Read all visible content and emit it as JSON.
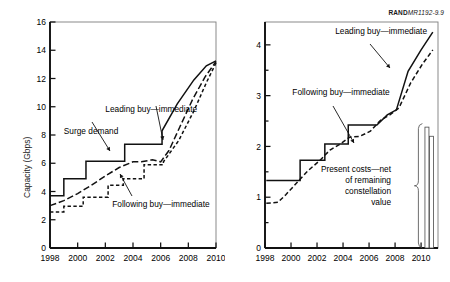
{
  "figure": {
    "credit_prefix": "RAND",
    "credit_id": "MR1192-9.9"
  },
  "chart_data": [
    {
      "id": "capacity",
      "type": "line",
      "title": "",
      "xlabel": "",
      "ylabel": "Capacity (Gbps)",
      "xlim": [
        1998,
        2010
      ],
      "ylim": [
        0,
        16
      ],
      "yticks": [
        0,
        2,
        4,
        6,
        8,
        10,
        12,
        14,
        16
      ],
      "ytick_labels": [
        "0",
        "2",
        "4",
        "6",
        "8",
        "10",
        "12",
        "14",
        "16"
      ],
      "xticks": [
        1998,
        2000,
        2002,
        2004,
        2006,
        2008,
        2010
      ],
      "xtick_labels": [
        "1998",
        "2000",
        "2002",
        "2004",
        "2006",
        "2008",
        "2010"
      ],
      "grid": false,
      "legend": "annotations",
      "annotations": [
        {
          "text": "Leading buy—immediate",
          "x": 2002.0,
          "y": 9.6
        },
        {
          "text": "Surge demand",
          "x": 1999.0,
          "y": 8.1
        },
        {
          "text": "Following buy—immediate",
          "x": 2002.5,
          "y": 2.9
        }
      ],
      "series": [
        {
          "name": "Surge demand",
          "style": "solid",
          "shape": "step",
          "x": [
            1998,
            1999,
            1999,
            2000.6,
            2000.6,
            2002,
            2002,
            2003.4,
            2003.4,
            2004.2,
            2004.2,
            2006.1,
            2006.1,
            2007.2,
            2008.4,
            2009.3,
            2010
          ],
          "y": [
            3.7,
            3.7,
            4.9,
            4.9,
            6.15,
            6.15,
            6.15,
            6.15,
            7.35,
            7.35,
            7.35,
            7.35,
            8.3,
            10.2,
            11.9,
            12.9,
            13.25
          ]
        },
        {
          "name": "Leading buy—immediate",
          "style": "long-dash",
          "shape": "line",
          "x": [
            1998,
            1999,
            2000,
            2001,
            2002,
            2003,
            2004,
            2004.6,
            2005.4,
            2006,
            2006.6,
            2007.4,
            2008.3,
            2009.2,
            2010
          ],
          "y": [
            3.0,
            3.35,
            3.85,
            4.45,
            5.1,
            5.7,
            6.1,
            6.1,
            6.25,
            6.1,
            6.9,
            8.6,
            10.5,
            12.1,
            13.2
          ]
        },
        {
          "name": "Following buy—immediate",
          "style": "short-dash",
          "shape": "step",
          "x": [
            1998,
            1999,
            1999,
            2000.4,
            2000.4,
            2002.2,
            2002.2,
            2003.3,
            2003.3,
            2004.8,
            2004.8,
            2006.2,
            2006.2,
            2007.3,
            2008.4,
            2009.3,
            2010
          ],
          "y": [
            2.55,
            2.55,
            2.95,
            2.95,
            3.6,
            3.6,
            4.45,
            4.45,
            4.9,
            4.9,
            5.9,
            5.9,
            6.1,
            7.6,
            9.7,
            11.7,
            13.1
          ]
        }
      ]
    },
    {
      "id": "cumulative-cost",
      "type": "line",
      "title": "",
      "xlabel": "",
      "ylabel": "Cumulative ($ billion FY'98)",
      "xlim": [
        1998,
        2011.3
      ],
      "ylim": [
        0,
        4.45
      ],
      "yticks": [
        0,
        0.5,
        1,
        1.5,
        2,
        2.5,
        3,
        3.5,
        4
      ],
      "ytick_labels": [
        "0",
        "",
        "1",
        "",
        "2",
        "",
        "3",
        "",
        "4"
      ],
      "xticks": [
        1998,
        2000,
        2002,
        2004,
        2006,
        2008,
        2010
      ],
      "xtick_labels": [
        "1998",
        "2000",
        "2002",
        "2004",
        "2006",
        "2008",
        "2010"
      ],
      "grid": false,
      "legend": "annotations",
      "annotations": [
        {
          "text": "Leading buy—immediate",
          "x": 2003.4,
          "y": 4.22
        },
        {
          "text": "Following buy—immediate",
          "x": 2000.1,
          "y": 3.02
        },
        {
          "text": "Present costs—net",
          "x": 2005.3,
          "y": 1.5
        },
        {
          "text": "of remaining",
          "x": 2005.9,
          "y": 1.28
        },
        {
          "text": "constellation",
          "x": 2005.9,
          "y": 1.06
        },
        {
          "text": "value",
          "x": 2006.8,
          "y": 0.84
        }
      ],
      "series": [
        {
          "name": "Leading buy—immediate",
          "style": "solid",
          "shape": "step",
          "x": [
            1998.1,
            1999.2,
            1999.2,
            2000.7,
            2000.7,
            2001.6,
            2001.6,
            2002.6,
            2002.6,
            2003.5,
            2003.5,
            2004.4,
            2004.4,
            2005.1,
            2006.6,
            2007.4,
            2008.1,
            2009.0,
            2010.0,
            2010.9
          ],
          "y": [
            1.33,
            1.33,
            1.33,
            1.33,
            1.73,
            1.73,
            1.73,
            1.73,
            2.05,
            2.05,
            2.05,
            2.05,
            2.42,
            2.42,
            2.42,
            2.62,
            2.72,
            3.48,
            3.9,
            4.25
          ]
        },
        {
          "name": "Following buy—immediate",
          "style": "dashed",
          "shape": "line",
          "x": [
            1998.1,
            1999.0,
            1999.6,
            2000.5,
            2001.3,
            2002.2,
            2003.0,
            2003.8,
            2004.5,
            2005.3,
            2006.1,
            2006.9,
            2007.6,
            2008.3,
            2009.2,
            2010.1,
            2010.9
          ],
          "y": [
            0.88,
            0.9,
            1.05,
            1.3,
            1.52,
            1.72,
            1.93,
            2.05,
            2.18,
            2.2,
            2.3,
            2.52,
            2.62,
            2.76,
            3.25,
            3.62,
            3.9
          ]
        }
      ],
      "bars": [
        {
          "name": "present-cost-bar-leading",
          "x": 2010.45,
          "y": 2.38
        },
        {
          "name": "present-cost-bar-following",
          "x": 2010.8,
          "y": 2.2
        }
      ]
    }
  ]
}
